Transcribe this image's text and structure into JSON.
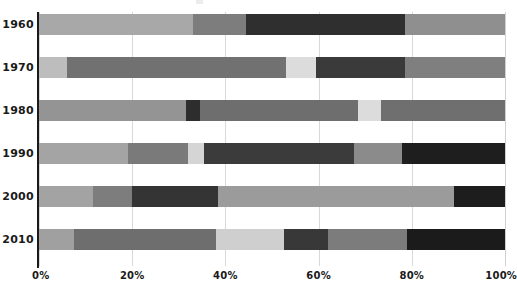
{
  "chart_data": {
    "type": "bar",
    "subtype": "stacked-horizontal-100-percent",
    "title": "",
    "subtitle": "",
    "xlabel": "",
    "ylabel": "",
    "xlim": [
      0,
      100
    ],
    "xticks": [
      0,
      20,
      40,
      60,
      80,
      100
    ],
    "xtick_labels": [
      "0%",
      "20%",
      "40%",
      "60%",
      "80%",
      "100%"
    ],
    "grid": "vertical",
    "legend": "none",
    "categories": [
      "1960",
      "1970",
      "1980",
      "1990",
      "2000",
      "2010"
    ],
    "palette": {
      "very_light": "#d9d9d9",
      "light": "#a8a8a8",
      "medium": "#7d7d7d",
      "dark": "#4a4a4a",
      "very_dark": "#2b2b2b",
      "black": "#1c1c1c"
    },
    "series": [
      {
        "name": "Segment 1",
        "values": [
          33.0,
          6.0,
          31.5,
          19.0,
          11.5,
          7.5
        ]
      },
      {
        "name": "Segment 2",
        "values": [
          11.5,
          47.0,
          3.0,
          13.0,
          8.5,
          30.5
        ]
      },
      {
        "name": "Segment 3",
        "values": [
          34.0,
          6.5,
          34.0,
          3.5,
          18.5,
          14.5
        ]
      },
      {
        "name": "Segment 4",
        "values": [
          21.5,
          19.0,
          15.5,
          32.0,
          35.5,
          9.5
        ]
      },
      {
        "name": "Segment 5",
        "values": [
          0.0,
          21.5,
          5.0,
          10.5,
          26.0,
          17.0
        ]
      },
      {
        "name": "Segment 6",
        "values": [
          0.0,
          0.0,
          11.0,
          22.0,
          0.0,
          21.0
        ]
      }
    ],
    "rows": [
      {
        "category": "1960",
        "segments": [
          {
            "value": 33.0,
            "color": "#a8a8a8"
          },
          {
            "value": 11.5,
            "color": "#7d7d7d"
          },
          {
            "value": 34.0,
            "color": "#2f2f2f"
          },
          {
            "value": 21.5,
            "color": "#8f8f8f"
          }
        ]
      },
      {
        "category": "1970",
        "segments": [
          {
            "value": 6.0,
            "color": "#bdbdbd"
          },
          {
            "value": 47.0,
            "color": "#717171"
          },
          {
            "value": 6.5,
            "color": "#dcdcdc"
          },
          {
            "value": 19.0,
            "color": "#3a3a3a"
          },
          {
            "value": 21.5,
            "color": "#7f7f7f"
          }
        ]
      },
      {
        "category": "1980",
        "segments": [
          {
            "value": 31.5,
            "color": "#949494"
          },
          {
            "value": 3.0,
            "color": "#2d2d2d"
          },
          {
            "value": 34.0,
            "color": "#6e6e6e"
          },
          {
            "value": 5.0,
            "color": "#dcdcdc"
          },
          {
            "value": 26.5,
            "color": "#6f6f6f"
          }
        ]
      },
      {
        "category": "1990",
        "segments": [
          {
            "value": 19.0,
            "color": "#a4a4a4"
          },
          {
            "value": 13.0,
            "color": "#7a7a7a"
          },
          {
            "value": 3.5,
            "color": "#d5d5d5"
          },
          {
            "value": 32.0,
            "color": "#3b3b3b"
          },
          {
            "value": 10.5,
            "color": "#8b8b8b"
          },
          {
            "value": 22.0,
            "color": "#1e1e1e"
          }
        ]
      },
      {
        "category": "2000",
        "segments": [
          {
            "value": 11.5,
            "color": "#a3a3a3"
          },
          {
            "value": 8.5,
            "color": "#7d7d7d"
          },
          {
            "value": 18.5,
            "color": "#343434"
          },
          {
            "value": 35.5,
            "color": "#9b9b9b"
          },
          {
            "value": 15.0,
            "color": "#9b9b9b"
          },
          {
            "value": 11.0,
            "color": "#1d1d1d"
          }
        ]
      },
      {
        "category": "2010",
        "segments": [
          {
            "value": 7.5,
            "color": "#a0a0a0"
          },
          {
            "value": 30.5,
            "color": "#6e6e6e"
          },
          {
            "value": 14.5,
            "color": "#cfcfcf"
          },
          {
            "value": 9.5,
            "color": "#383838"
          },
          {
            "value": 17.0,
            "color": "#7c7c7c"
          },
          {
            "value": 21.0,
            "color": "#1b1b1b"
          }
        ]
      }
    ]
  },
  "axes": {
    "y_tick_labels": [
      "1960",
      "1970",
      "1980",
      "1990",
      "2000",
      "2010"
    ],
    "x_tick_labels": [
      "0%",
      "20%",
      "40%",
      "60%",
      "80%",
      "100%"
    ]
  }
}
